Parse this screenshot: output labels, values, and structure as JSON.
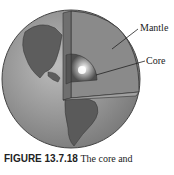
{
  "diagram": {
    "labels": {
      "mantle": "Mantle",
      "core": "Core"
    },
    "caption": {
      "figure_number": "FIGURE 13.7.18",
      "text": "The core and"
    }
  }
}
